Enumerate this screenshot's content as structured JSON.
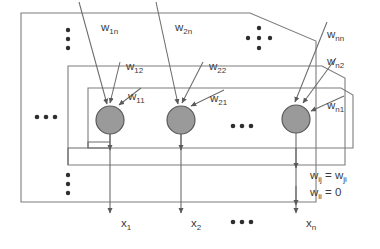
{
  "figure": {
    "type": "neural-network-diagram",
    "name": "hopfield-network",
    "colors": {
      "neuron_fill": "#999999",
      "neuron_stroke": "#555555",
      "line": "#6b6b6b",
      "text": "#3a3a3a",
      "background": "#ffffff"
    }
  },
  "neurons": [
    {
      "id": "neuron-1",
      "cx": 110,
      "cy": 120,
      "r": 14
    },
    {
      "id": "neuron-2",
      "cx": 181,
      "cy": 120,
      "r": 14
    },
    {
      "id": "neuron-3",
      "cx": 296,
      "cy": 119,
      "r": 14
    }
  ],
  "weights": [
    {
      "key": "w1n",
      "base": "w",
      "sub": "1n",
      "x": 103,
      "y": 28
    },
    {
      "key": "w2n",
      "base": "w",
      "sub": "2n",
      "x": 177,
      "y": 28
    },
    {
      "key": "wnn",
      "base": "w",
      "sub": "nn",
      "x": 329,
      "y": 35
    },
    {
      "key": "w12",
      "base": "w",
      "sub": "12",
      "x": 129,
      "y": 68
    },
    {
      "key": "w22",
      "base": "w",
      "sub": "22",
      "x": 212,
      "y": 68
    },
    {
      "key": "wn2",
      "base": "w",
      "sub": "n2",
      "x": 329,
      "y": 62
    },
    {
      "key": "w11",
      "base": "w",
      "sub": "11",
      "x": 129,
      "y": 97
    },
    {
      "key": "w21",
      "base": "w",
      "sub": "21",
      "x": 212,
      "y": 99
    },
    {
      "key": "wn1",
      "base": "w",
      "sub": "n1",
      "x": 329,
      "y": 106
    }
  ],
  "outputs": [
    {
      "key": "x1",
      "base": "x",
      "sub": "1",
      "x": 123,
      "y": 224
    },
    {
      "key": "x2",
      "base": "x",
      "sub": "2",
      "x": 193,
      "y": 224
    },
    {
      "key": "xn",
      "base": "x",
      "sub": "n",
      "x": 308,
      "y": 224
    }
  ],
  "formulas": [
    {
      "key": "symmetry",
      "text_lhs": "w",
      "sub_lhs": "ij",
      "eq": " = ",
      "text_rhs": "w",
      "sub_rhs": "ji",
      "x": 312,
      "y": 176
    },
    {
      "key": "no-self-connection",
      "text_lhs": "w",
      "sub_lhs": "ii",
      "eq": " = ",
      "text_rhs": "0",
      "sub_rhs": "",
      "x": 312,
      "y": 193
    }
  ],
  "ellipses": [
    {
      "key": "left-horizontal-ellipsis",
      "style": "horizontal",
      "x": 45,
      "y": 115
    },
    {
      "key": "middle-horizontal-ellipsis",
      "style": "horizontal",
      "x": 240,
      "y": 124
    },
    {
      "key": "bottom-horizontal-ellipsis",
      "style": "horizontal",
      "x": 240,
      "y": 222
    },
    {
      "key": "upper-vertical-ellipsis",
      "style": "vertical",
      "x": 68,
      "y": 38
    },
    {
      "key": "lower-vertical-ellipsis",
      "style": "vertical",
      "x": 68,
      "y": 183
    },
    {
      "key": "diagonal-dot-cluster",
      "style": "cross",
      "x": 259,
      "y": 38
    }
  ]
}
